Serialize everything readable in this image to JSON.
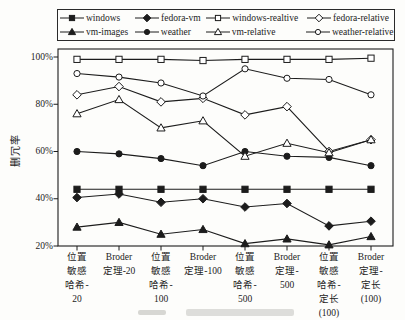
{
  "figure": {
    "y_axis_title": "删冗率",
    "background": "#fdfdfb",
    "ink_color": "#1c1c1c"
  },
  "chart_data": {
    "type": "line",
    "title": "",
    "ylabel": "删冗率",
    "xlabel": "",
    "ylim": [
      20,
      100
    ],
    "y_tick_labels": [
      "100%",
      "80%",
      "60%",
      "40%",
      "20%"
    ],
    "grid": false,
    "legend_position": "top",
    "categories": [
      "位置敏感哈希-20",
      "Broder定理-20",
      "位置敏感哈希-100",
      "Broder定理-100",
      "位置敏感哈希-500",
      "Broder定理-500",
      "位置敏感哈希-定长(100)",
      "Broder定理-定长(100)"
    ],
    "category_label_lines": [
      [
        "位置",
        "敏感",
        "哈希-",
        "20"
      ],
      [
        "Broder",
        "定理-20"
      ],
      [
        "位置",
        "敏感",
        "哈希-",
        "100"
      ],
      [
        "Broder",
        "定理-100"
      ],
      [
        "位置",
        "敏感",
        "哈希-",
        "500"
      ],
      [
        "Broder",
        "定理-",
        "500"
      ],
      [
        "位置",
        "敏感",
        "哈希-",
        "定长",
        "(100)"
      ],
      [
        "Broder",
        "定理-",
        "定长",
        "(100)"
      ]
    ],
    "series": [
      {
        "name": "windows",
        "marker": "square",
        "fill": "filled",
        "values": [
          44,
          44,
          44,
          44,
          44,
          44,
          44,
          44
        ]
      },
      {
        "name": "fedora-vm",
        "marker": "diamond",
        "fill": "filled",
        "values": [
          40.5,
          42,
          38.5,
          40,
          36.5,
          38,
          28.5,
          30.5
        ]
      },
      {
        "name": "windows-realtive",
        "marker": "square",
        "fill": "open",
        "values": [
          99,
          99,
          99,
          98.5,
          99,
          99,
          99,
          99.5
        ]
      },
      {
        "name": "fedora-relative",
        "marker": "diamond",
        "fill": "open",
        "values": [
          84,
          87.5,
          81,
          82.5,
          75.5,
          79,
          60,
          65
        ]
      },
      {
        "name": "vm-images",
        "marker": "triangle",
        "fill": "filled",
        "values": [
          28,
          30,
          25,
          27,
          21,
          23,
          20.5,
          24
        ]
      },
      {
        "name": "weather",
        "marker": "circle",
        "fill": "filled",
        "values": [
          60,
          59,
          57,
          54,
          60,
          58,
          57.5,
          54
        ]
      },
      {
        "name": "vm-relative",
        "marker": "triangle",
        "fill": "open",
        "values": [
          76,
          82,
          70,
          73,
          58,
          63.5,
          59.5,
          65
        ]
      },
      {
        "name": "weather-relative",
        "marker": "circle",
        "fill": "open",
        "values": [
          93,
          91.5,
          89,
          83.5,
          95,
          91,
          90.5,
          84
        ]
      }
    ],
    "legend_rows": [
      [
        "windows",
        "fedora-vm",
        "windows-realtive",
        "fedora-relative"
      ],
      [
        "vm-images",
        "weather",
        "vm-relative",
        "weather-relative"
      ]
    ]
  }
}
